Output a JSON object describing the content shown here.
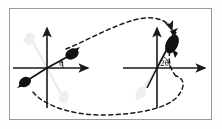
{
  "figure": {
    "caption_present": false,
    "frame": {
      "border_color": "#9a9a9a",
      "background_color": "#ffffff"
    },
    "colors": {
      "axis": "#1a1a1a",
      "vector_dark": "#111111",
      "vector_ghost": "#ebebeb",
      "dashed_path": "#1a1a1a",
      "frame_border": "#9a9a9a",
      "page_background": "#fdfdfd"
    },
    "panels": [
      {
        "id": "left-panel",
        "name": "initial-state",
        "origin": {
          "x": 47,
          "y": 68
        },
        "angle_label": "θ",
        "angle_label_position": {
          "x": 59,
          "y": 66
        },
        "axes": [
          {
            "name": "x-axis",
            "direction": "right",
            "arrow": true
          },
          {
            "name": "y-axis",
            "direction": "up",
            "arrow": true
          },
          {
            "name": "y-axis-lower",
            "direction": "down",
            "arrow": false
          }
        ],
        "vectors": [
          {
            "name": "dark-vector-upper-right",
            "style": "dark",
            "angle_deg": 28
          },
          {
            "name": "dark-vector-lower-left",
            "style": "dark",
            "angle_deg": 208
          },
          {
            "name": "ghost-vector-upper-left",
            "style": "ghost",
            "angle_deg": 118
          },
          {
            "name": "ghost-vector-lower-right",
            "style": "ghost",
            "angle_deg": 298
          }
        ]
      },
      {
        "id": "right-panel",
        "name": "rotated-state",
        "origin": {
          "x": 157,
          "y": 68
        },
        "angle_label": "2θ",
        "angle_label_position": {
          "x": 161,
          "y": 66
        },
        "axes": [
          {
            "name": "x-axis",
            "direction": "right",
            "arrow": true
          },
          {
            "name": "y-axis",
            "direction": "up",
            "arrow": true
          },
          {
            "name": "y-axis-lower",
            "direction": "down",
            "arrow": false
          }
        ],
        "vectors": [
          {
            "name": "dark-vector-upper-right",
            "style": "dark",
            "angle_deg": 72
          },
          {
            "name": "dark-vector-lower-left",
            "style": "dark",
            "angle_deg": 252
          },
          {
            "name": "ghost-vector-lower-left",
            "style": "ghost",
            "angle_deg": 208
          }
        ]
      }
    ],
    "dashed_loop": {
      "name": "dashed-transition-loop",
      "style": "dashed",
      "closed": true,
      "description": "closed dashed curve looping over the top between panels and returning beneath both panels"
    }
  }
}
